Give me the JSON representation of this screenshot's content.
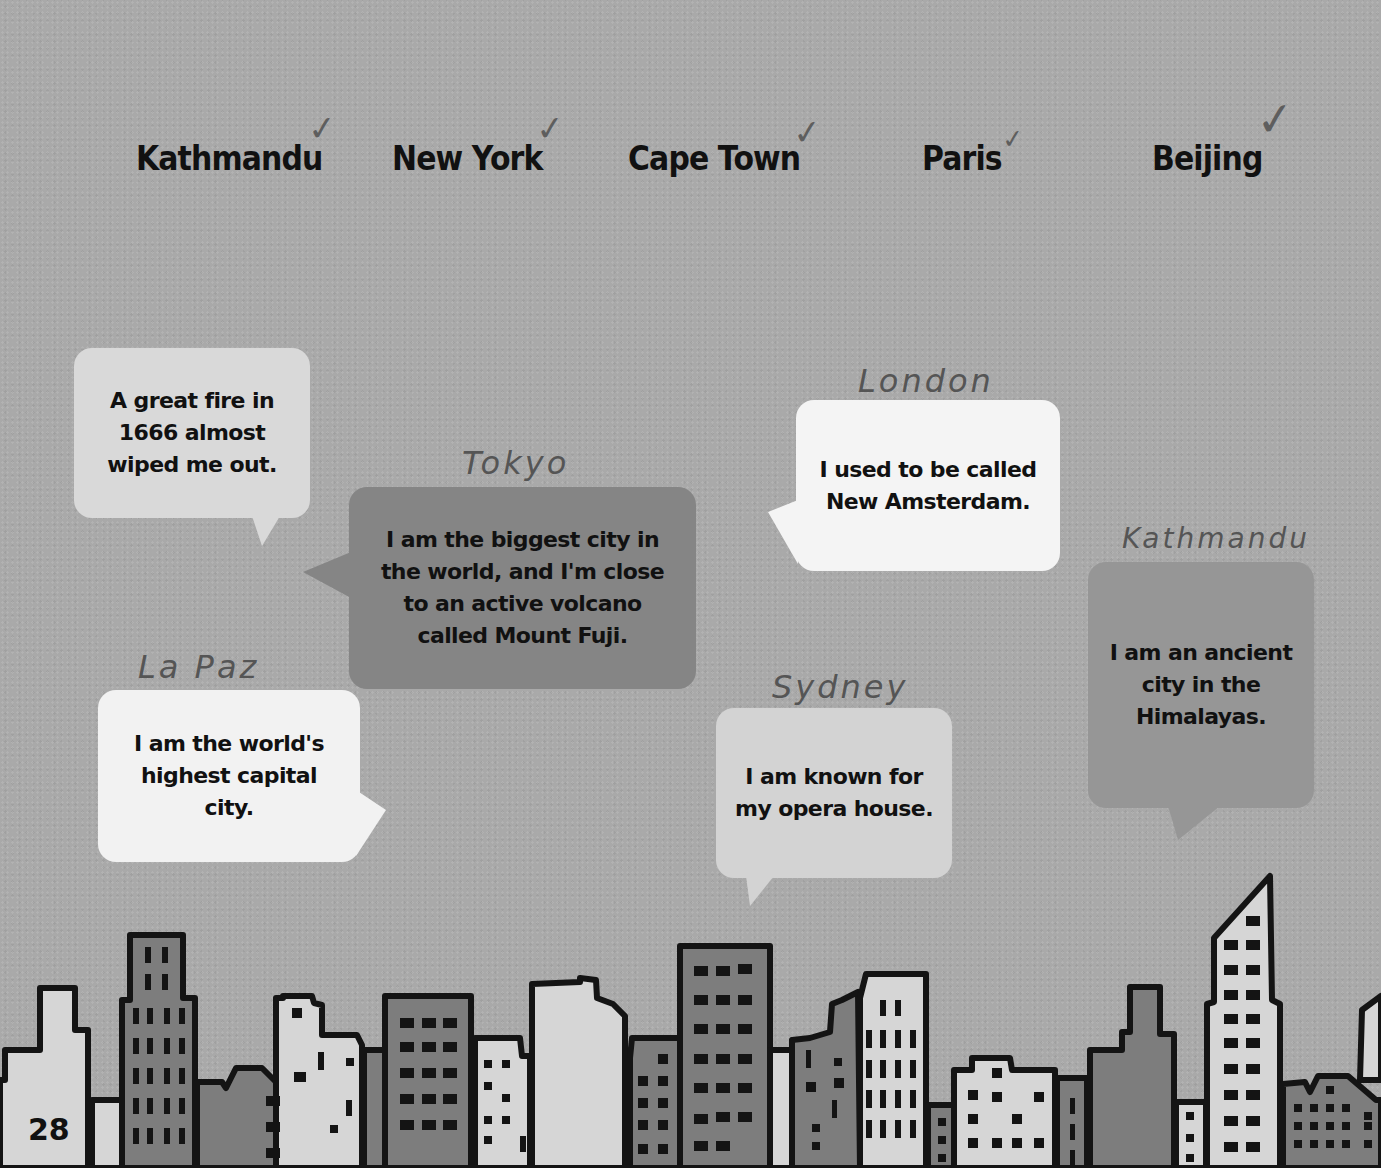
{
  "page": {
    "page_number": "28",
    "background_color": "#a9a9a9"
  },
  "city_list": {
    "items": [
      {
        "name": "Kathmandu",
        "checked": true,
        "check_mark": "✓"
      },
      {
        "name": "New York",
        "checked": true,
        "check_mark": "✓"
      },
      {
        "name": "Cape Town",
        "checked": true,
        "check_mark": "✓"
      },
      {
        "name": "Paris",
        "checked": true,
        "check_mark": "✓"
      },
      {
        "name": "Beijing",
        "checked": true,
        "check_mark": "✓"
      }
    ]
  },
  "bubbles": [
    {
      "clue": "A great fire in\n1666 almost\nwiped me out.",
      "answer": "",
      "color": "#d9d9d9"
    },
    {
      "clue": "I am the biggest city in\nthe world, and I'm close\nto an active volcano\ncalled Mount Fuji.",
      "answer": "Tokyo",
      "color": "#858585"
    },
    {
      "clue": "I am the world's\nhighest capital city.",
      "answer": "La Paz",
      "color": "#f2f2f2"
    },
    {
      "clue": "I used to be called\nNew Amsterdam.",
      "answer": "London",
      "color": "#f4f4f4"
    },
    {
      "clue": "I am known for\nmy opera house.",
      "answer": "Sydney",
      "color": "#d3d3d3"
    },
    {
      "clue": "I am an ancient\ncity in the\nHimalayas.",
      "answer": "Kathmandu",
      "color": "#969696"
    }
  ],
  "colors": {
    "building_light": "#d6d6d6",
    "building_dark": "#7d7d7d",
    "outline": "#141414",
    "handwriting": "#555555"
  }
}
